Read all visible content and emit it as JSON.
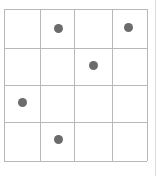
{
  "grid": {
    "rows": 4,
    "cols": 4,
    "line_color": "#b8b8b8",
    "dot_color": "#6b6b6b",
    "col_lines_px": [
      0,
      36,
      70,
      108,
      143
    ],
    "row_lines_px": [
      0,
      39,
      76,
      113,
      152
    ]
  },
  "dots": [
    {
      "row": 0,
      "col": 1,
      "cx": 54,
      "cy": 19
    },
    {
      "row": 0,
      "col": 3,
      "cx": 124,
      "cy": 18
    },
    {
      "row": 1,
      "col": 2,
      "cx": 89,
      "cy": 56
    },
    {
      "row": 2,
      "col": 0,
      "cx": 18,
      "cy": 93
    },
    {
      "row": 3,
      "col": 1,
      "cx": 54,
      "cy": 130
    }
  ]
}
